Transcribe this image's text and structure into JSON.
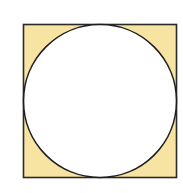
{
  "diagram": {
    "square": {
      "x": 23.5,
      "y": 24.5,
      "size": 153,
      "fill": "#f8e4a2",
      "stroke": "#2a2a2a"
    },
    "circle": {
      "cx": 100,
      "cy": 101,
      "r": 76.5,
      "fill": "#ffffff",
      "stroke": "#1e1e1e"
    },
    "background": "#ffffff"
  }
}
